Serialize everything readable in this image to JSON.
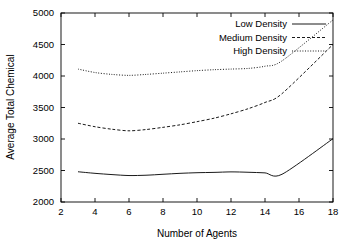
{
  "chart_data": {
    "type": "line",
    "title": "",
    "xlabel": "Number of Agents",
    "ylabel": "Average Total Chemical",
    "xlim": [
      2,
      18
    ],
    "ylim": [
      2000,
      5000
    ],
    "xticks": [
      2,
      4,
      6,
      8,
      10,
      12,
      14,
      16,
      18
    ],
    "yticks": [
      2000,
      2500,
      3000,
      3500,
      4000,
      4500,
      5000
    ],
    "xticklabels": [
      "2",
      "4",
      "6",
      "8",
      "10",
      "12",
      "14",
      "16",
      "18"
    ],
    "yticklabels": [
      "2000",
      "2500",
      "3000",
      "3500",
      "4000",
      "4500",
      "5000"
    ],
    "grid": false,
    "legend_position": "top-right",
    "x": [
      3,
      4,
      5,
      6,
      7,
      8,
      9,
      10,
      11,
      12,
      13,
      14,
      15,
      18
    ],
    "series": [
      {
        "name": "Low Density",
        "style": "solid",
        "values": [
          2480,
          2455,
          2435,
          2420,
          2425,
          2440,
          2455,
          2465,
          2470,
          2478,
          2472,
          2462,
          2440,
          3005
        ]
      },
      {
        "name": "Medium Density",
        "style": "dashed",
        "values": [
          3250,
          3195,
          3155,
          3130,
          3150,
          3185,
          3225,
          3275,
          3330,
          3400,
          3480,
          3580,
          3720,
          4500
        ]
      },
      {
        "name": "High Density",
        "style": "dotted",
        "values": [
          4110,
          4055,
          4025,
          4010,
          4025,
          4045,
          4065,
          4085,
          4100,
          4110,
          4120,
          4155,
          4240,
          4890
        ]
      }
    ]
  },
  "legend": {
    "items": [
      {
        "label": "Low Density",
        "style": "solid"
      },
      {
        "label": "Medium Density",
        "style": "dashed"
      },
      {
        "label": "High Density",
        "style": "dotted"
      }
    ]
  },
  "axes": {
    "x_title": "Number of Agents",
    "y_title": "Average Total Chemical"
  }
}
